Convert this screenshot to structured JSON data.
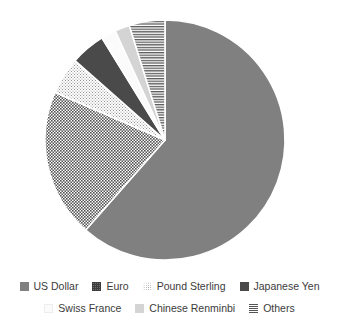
{
  "chart_data": {
    "type": "pie",
    "title": "",
    "subtitle": "",
    "xlabel": "",
    "ylabel": "",
    "legend_position": "bottom",
    "grid": false,
    "start_angle_deg": 0,
    "direction": "clockwise",
    "categories": [
      "US Dollar",
      "Euro",
      "Pound Sterling",
      "Japanese Yen",
      "Swiss France",
      "Chinese Renminbi",
      "Others"
    ],
    "values": [
      61.5,
      20.0,
      5.0,
      4.7,
      2.0,
      2.0,
      4.8
    ],
    "slices": [
      {
        "label": "US Dollar",
        "value": 61.5,
        "start_deg": 0,
        "end_deg": 221.4,
        "fill": "#808080",
        "pattern": "solid",
        "swatch_class": "sw-usd"
      },
      {
        "label": "Euro",
        "value": 20.0,
        "start_deg": 221.4,
        "end_deg": 293.4,
        "fill": "#6e6e6e",
        "pattern": "grid-dots-dark",
        "swatch_class": "sw-eur"
      },
      {
        "label": "Pound Sterling",
        "value": 5.0,
        "start_deg": 293.4,
        "end_deg": 311.4,
        "fill": "#ffffff",
        "pattern": "fine-dots-light",
        "swatch_class": "sw-gbp"
      },
      {
        "label": "Japanese Yen",
        "value": 4.7,
        "start_deg": 311.4,
        "end_deg": 328.3,
        "fill": "#4a4a4a",
        "pattern": "solid",
        "swatch_class": "sw-jpy"
      },
      {
        "label": "Swiss France",
        "value": 2.0,
        "start_deg": 328.3,
        "end_deg": 335.5,
        "fill": "#fbfbfb",
        "pattern": "solid",
        "swatch_class": "sw-chf"
      },
      {
        "label": "Chinese Renminbi",
        "value": 2.0,
        "start_deg": 335.5,
        "end_deg": 342.7,
        "fill": "#d4d4d4",
        "pattern": "solid",
        "swatch_class": "sw-cny"
      },
      {
        "label": "Others",
        "value": 4.8,
        "start_deg": 342.7,
        "end_deg": 360,
        "fill": "#ffffff",
        "pattern": "horizontal-stripes",
        "swatch_class": "sw-oth"
      }
    ]
  },
  "legend": {
    "rows": [
      [
        {
          "label": "US Dollar",
          "swatch_class": "sw-usd",
          "name": "legend-item-us-dollar"
        },
        {
          "label": "Euro",
          "swatch_class": "sw-eur",
          "name": "legend-item-euro"
        },
        {
          "label": "Pound Sterling",
          "swatch_class": "sw-gbp",
          "name": "legend-item-pound-sterling"
        },
        {
          "label": "Japanese Yen",
          "swatch_class": "sw-jpy",
          "name": "legend-item-japanese-yen"
        }
      ],
      [
        {
          "label": "Swiss France",
          "swatch_class": "sw-chf",
          "name": "legend-item-swiss-france"
        },
        {
          "label": "Chinese Renminbi",
          "swatch_class": "sw-cny",
          "name": "legend-item-chinese-renminbi"
        },
        {
          "label": "Others",
          "swatch_class": "sw-oth",
          "name": "legend-item-others"
        }
      ]
    ]
  },
  "colors": {
    "background": "#ffffff",
    "text": "#3b3b3b",
    "us_dollar": "#808080",
    "euro": "#6e6e6e",
    "pound_sterling": "#ffffff",
    "japanese_yen": "#4a4a4a",
    "swiss_france": "#fbfbfb",
    "chinese_renminbi": "#d4d4d4",
    "others": "#ffffff"
  }
}
